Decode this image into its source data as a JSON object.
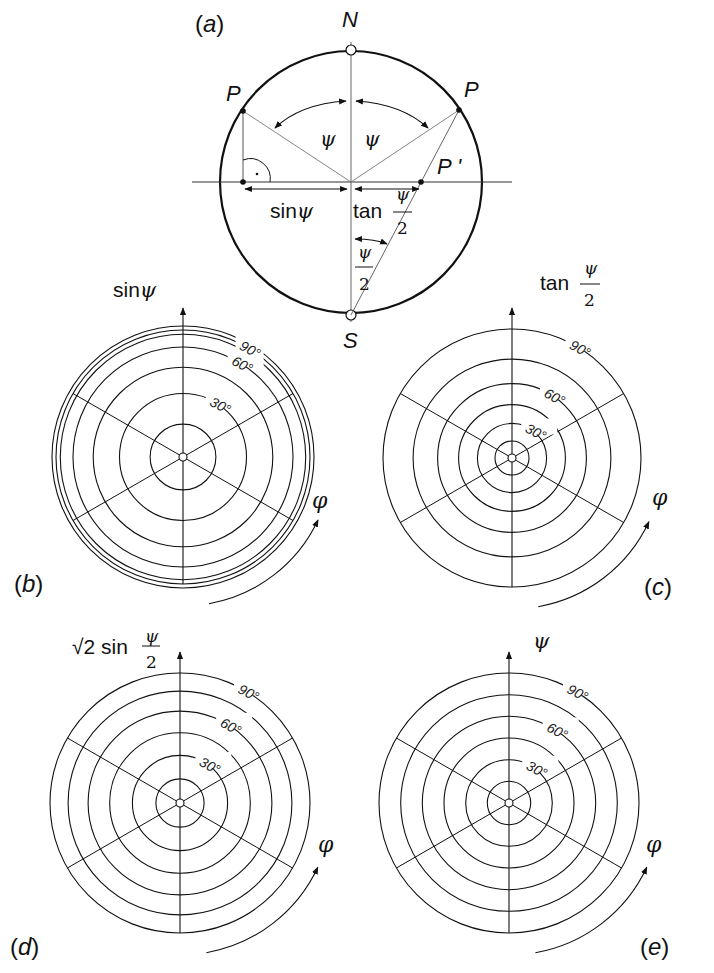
{
  "figure": {
    "panel_a": {
      "label": "(a)",
      "north": "N",
      "south": "S",
      "point_left": "P",
      "point_right": "P",
      "projected_point": "P '",
      "angle_left": "ψ",
      "angle_right": "ψ",
      "sin_label": "sinψ",
      "tan_label_prefix": "tan",
      "frac_num": "ψ",
      "frac_den": "2"
    },
    "panel_b": {
      "label": "(b)",
      "axis_label": "sinψ",
      "azimuth": "φ",
      "ticks": [
        "30°",
        "60°",
        "90°"
      ]
    },
    "panel_c": {
      "label": "(c)",
      "axis_label_prefix": "tan",
      "frac_num": "ψ",
      "frac_den": "2",
      "azimuth": "φ",
      "ticks": [
        "30°",
        "60°",
        "90°"
      ]
    },
    "panel_d": {
      "label": "(d)",
      "axis_label_prefix": "√2 sin",
      "frac_num": "ψ",
      "frac_den": "2",
      "azimuth": "φ",
      "ticks": [
        "30°",
        "60°",
        "90°"
      ]
    },
    "panel_e": {
      "label": "(e)",
      "axis_label": "ψ",
      "azimuth": "φ",
      "ticks": [
        "30°",
        "60°",
        "90°"
      ]
    }
  },
  "chart_data": {
    "type": "polar-grid-comparison",
    "rings_psi_deg": [
      15,
      30,
      45,
      60,
      75,
      90
    ],
    "radial_lines_deg": [
      30,
      90,
      150,
      210,
      270,
      330
    ],
    "panels": [
      {
        "id": "b",
        "mapping": "sin(psi)",
        "ring_fraction": [
          0.259,
          0.5,
          0.707,
          0.866,
          0.966,
          1.0
        ]
      },
      {
        "id": "c",
        "mapping": "tan(psi/2)",
        "ring_fraction": [
          0.132,
          0.268,
          0.414,
          0.577,
          0.767,
          1.0
        ]
      },
      {
        "id": "d",
        "mapping": "sqrt2*sin(psi/2)",
        "ring_fraction": [
          0.185,
          0.366,
          0.541,
          0.707,
          0.861,
          1.0
        ]
      },
      {
        "id": "e",
        "mapping": "psi",
        "ring_fraction": [
          0.167,
          0.333,
          0.5,
          0.667,
          0.833,
          1.0
        ]
      }
    ]
  }
}
